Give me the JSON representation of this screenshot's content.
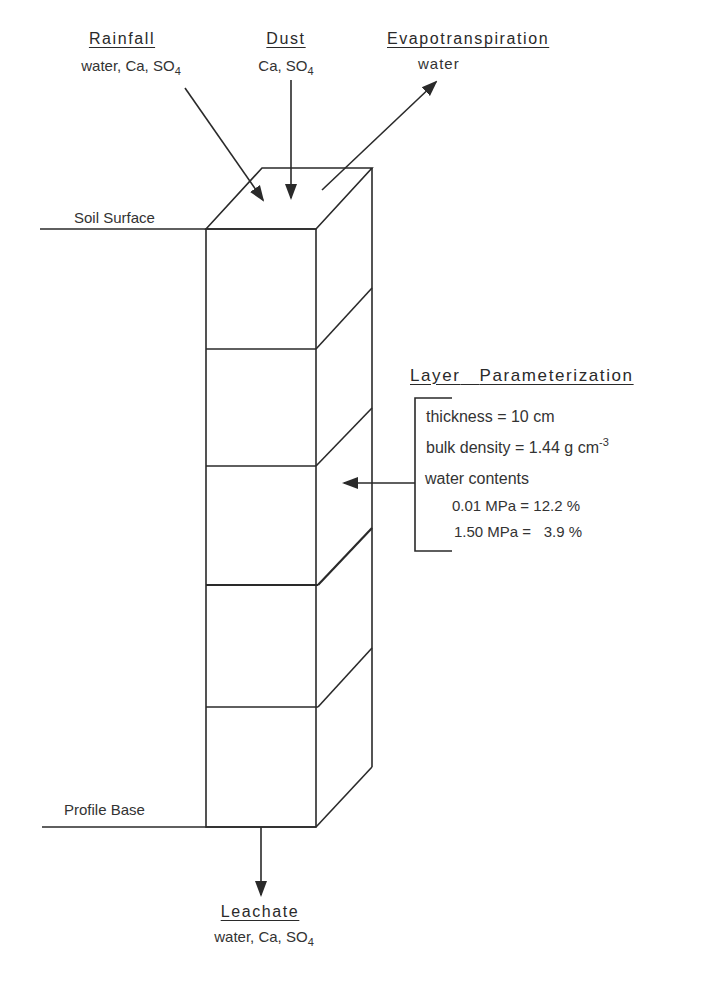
{
  "inputs": {
    "rainfall": {
      "title": "Rainfall",
      "species_prefix": "water, Ca, SO",
      "subscript": "4"
    },
    "dust": {
      "title": "Dust",
      "species_prefix": "Ca, SO",
      "subscript": "4"
    },
    "evapotranspiration": {
      "title": "Evapotranspiration",
      "species": "water"
    }
  },
  "boundaries": {
    "soil_surface": "Soil  Surface",
    "profile_base": "Profile  Base"
  },
  "layer_parameterization": {
    "title_1": "Layer",
    "title_2": "Parameterization",
    "thickness": "thickness = 10 cm",
    "bulk_density_prefix": "bulk density = 1.44 g cm",
    "bulk_density_exponent": "-3",
    "water_contents_label": "water  contents",
    "wc_001": "0.01 MPa = 12.2 %",
    "wc_150": "1.50 MPa =   3.9 %"
  },
  "output": {
    "leachate": {
      "title": "Leachate",
      "species_prefix": "water, Ca, SO",
      "subscript": "4"
    }
  },
  "profile": {
    "layer_count": 5,
    "line_color": "#2a2a2a"
  }
}
